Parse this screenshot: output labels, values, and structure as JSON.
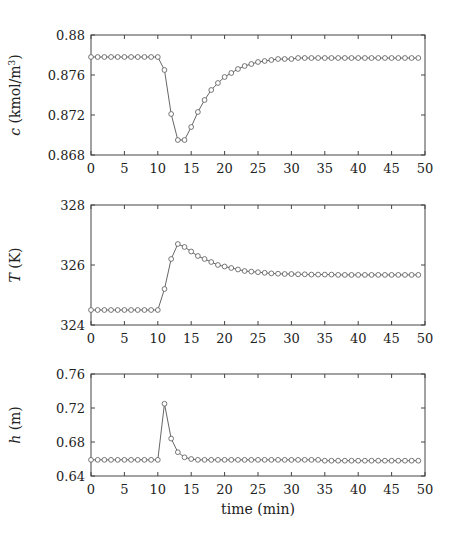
{
  "chart_data": [
    {
      "type": "line",
      "title": "",
      "xlabel": "",
      "ylabel": "c (kmol/m3)",
      "ylabel_parts": {
        "var": "c",
        "unit_pre": " (kmol/m",
        "sup": "3",
        "unit_post": ")"
      },
      "xlim": [
        0,
        50
      ],
      "ylim": [
        0.868,
        0.88
      ],
      "xticks": [
        0,
        5,
        10,
        15,
        20,
        25,
        30,
        35,
        40,
        45,
        50
      ],
      "yticks": [
        0.868,
        0.872,
        0.876,
        0.88
      ],
      "ytick_labels": [
        "0.868",
        "0.872",
        "0.876",
        "0.88"
      ],
      "grid": false,
      "marker": "circle-open",
      "series": [
        {
          "name": "c",
          "x": [
            0,
            1,
            2,
            3,
            4,
            5,
            6,
            7,
            8,
            9,
            10,
            11,
            12,
            13,
            14,
            15,
            16,
            17,
            18,
            19,
            20,
            21,
            22,
            23,
            24,
            25,
            26,
            27,
            28,
            29,
            30,
            31,
            32,
            33,
            34,
            35,
            36,
            37,
            38,
            39,
            40,
            41,
            42,
            43,
            44,
            45,
            46,
            47,
            48,
            49
          ],
          "values": [
            0.8778,
            0.8778,
            0.8778,
            0.8778,
            0.8778,
            0.8778,
            0.8778,
            0.8778,
            0.8778,
            0.8778,
            0.8778,
            0.8765,
            0.8721,
            0.8695,
            0.8695,
            0.8708,
            0.8723,
            0.8735,
            0.8745,
            0.8752,
            0.8758,
            0.8762,
            0.8766,
            0.8769,
            0.8771,
            0.8773,
            0.8774,
            0.8775,
            0.8776,
            0.8776,
            0.8776,
            0.8777,
            0.8777,
            0.8777,
            0.8777,
            0.8777,
            0.8777,
            0.8777,
            0.8777,
            0.8777,
            0.8777,
            0.8777,
            0.8777,
            0.8777,
            0.8777,
            0.8777,
            0.8777,
            0.8777,
            0.8777,
            0.8777
          ]
        }
      ]
    },
    {
      "type": "line",
      "title": "",
      "xlabel": "",
      "ylabel": "T (K)",
      "ylabel_parts": {
        "var": "T",
        "unit_pre": " (K)",
        "sup": "",
        "unit_post": ""
      },
      "xlim": [
        0,
        50
      ],
      "ylim": [
        324,
        328
      ],
      "xticks": [
        0,
        5,
        10,
        15,
        20,
        25,
        30,
        35,
        40,
        45,
        50
      ],
      "yticks": [
        324,
        326,
        328
      ],
      "ytick_labels": [
        "324",
        "326",
        "328"
      ],
      "grid": false,
      "marker": "circle-open",
      "series": [
        {
          "name": "T",
          "x": [
            0,
            1,
            2,
            3,
            4,
            5,
            6,
            7,
            8,
            9,
            10,
            11,
            12,
            13,
            14,
            15,
            16,
            17,
            18,
            19,
            20,
            21,
            22,
            23,
            24,
            25,
            26,
            27,
            28,
            29,
            30,
            31,
            32,
            33,
            34,
            35,
            36,
            37,
            38,
            39,
            40,
            41,
            42,
            43,
            44,
            45,
            46,
            47,
            48,
            49
          ],
          "values": [
            324.5,
            324.5,
            324.5,
            324.5,
            324.5,
            324.5,
            324.5,
            324.5,
            324.5,
            324.5,
            324.5,
            325.2,
            326.2,
            326.7,
            326.6,
            326.45,
            326.3,
            326.2,
            326.1,
            326.0,
            325.95,
            325.9,
            325.85,
            325.8,
            325.78,
            325.76,
            325.74,
            325.72,
            325.71,
            325.7,
            325.7,
            325.69,
            325.69,
            325.68,
            325.68,
            325.68,
            325.68,
            325.67,
            325.67,
            325.67,
            325.67,
            325.67,
            325.67,
            325.67,
            325.67,
            325.67,
            325.67,
            325.67,
            325.67,
            325.67
          ]
        }
      ]
    },
    {
      "type": "line",
      "title": "",
      "xlabel": "time (min)",
      "ylabel": "h (m)",
      "ylabel_parts": {
        "var": "h",
        "unit_pre": " (m)",
        "sup": "",
        "unit_post": ""
      },
      "xlim": [
        0,
        50
      ],
      "ylim": [
        0.64,
        0.76
      ],
      "xticks": [
        0,
        5,
        10,
        15,
        20,
        25,
        30,
        35,
        40,
        45,
        50
      ],
      "yticks": [
        0.64,
        0.68,
        0.72,
        0.76
      ],
      "ytick_labels": [
        "0.64",
        "0.68",
        "0.72",
        "0.76"
      ],
      "grid": false,
      "marker": "circle-open",
      "series": [
        {
          "name": "h",
          "x": [
            0,
            1,
            2,
            3,
            4,
            5,
            6,
            7,
            8,
            9,
            10,
            11,
            12,
            13,
            14,
            15,
            16,
            17,
            18,
            19,
            20,
            21,
            22,
            23,
            24,
            25,
            26,
            27,
            28,
            29,
            30,
            31,
            32,
            33,
            34,
            35,
            36,
            37,
            38,
            39,
            40,
            41,
            42,
            43,
            44,
            45,
            46,
            47,
            48,
            49
          ],
          "values": [
            0.659,
            0.659,
            0.659,
            0.659,
            0.659,
            0.659,
            0.659,
            0.659,
            0.659,
            0.659,
            0.659,
            0.725,
            0.684,
            0.668,
            0.662,
            0.66,
            0.659,
            0.659,
            0.659,
            0.659,
            0.659,
            0.659,
            0.659,
            0.659,
            0.659,
            0.659,
            0.659,
            0.659,
            0.659,
            0.659,
            0.659,
            0.659,
            0.659,
            0.659,
            0.659,
            0.658,
            0.658,
            0.658,
            0.658,
            0.658,
            0.658,
            0.658,
            0.658,
            0.658,
            0.658,
            0.658,
            0.658,
            0.658,
            0.658,
            0.658
          ]
        }
      ]
    }
  ],
  "style": {
    "line_color": "#555555",
    "marker_color": "#555555",
    "axis_color": "#444444"
  }
}
